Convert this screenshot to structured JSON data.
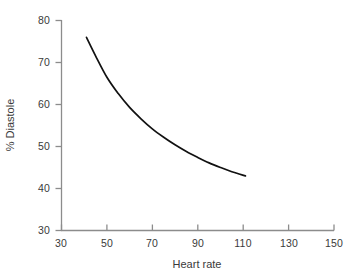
{
  "chart_data": {
    "type": "line",
    "title": "",
    "subtitle": "",
    "xlabel": "Heart rate",
    "ylabel": "% Diastole",
    "xlim": [
      30,
      150
    ],
    "ylim": [
      30,
      80
    ],
    "xticks": [
      30,
      50,
      70,
      90,
      110,
      130,
      150
    ],
    "yticks": [
      30,
      40,
      50,
      60,
      70,
      80
    ],
    "xtick_labels": [
      "30",
      "50",
      "70",
      "90",
      "110",
      "130",
      "150"
    ],
    "ytick_labels": [
      "30",
      "40",
      "50",
      "60",
      "70",
      "80"
    ],
    "grid": false,
    "legend": "none",
    "series": [
      {
        "name": "% Diastole vs Heart rate",
        "color": "#111111",
        "x": [
          41,
          45,
          50,
          55,
          60,
          65,
          70,
          75,
          80,
          85,
          90,
          95,
          100,
          105,
          111
        ],
        "y": [
          76.0,
          71.6,
          66.5,
          62.6,
          59.3,
          56.6,
          54.2,
          52.2,
          50.4,
          48.8,
          47.4,
          46.1,
          45.0,
          44.0,
          43.0
        ]
      }
    ],
    "annotations": []
  },
  "axes": {
    "line_color": "#8c8c8c",
    "tick_color": "#8c8c8c"
  }
}
